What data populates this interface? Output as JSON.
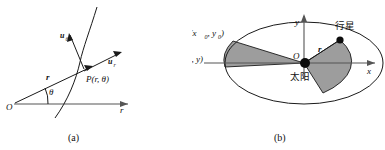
{
  "figure": {
    "background_color": "#ffffff",
    "ink_color": "#1a1a1a",
    "sector_fill_color": "#9d9d9d",
    "panels": [
      {
        "id": "a",
        "caption": "(a)",
        "title": "polar coordinate unit vectors at a point on a curve",
        "labels": {
          "origin": "O",
          "radial_axis": "r",
          "angle": "θ",
          "position_vector": "r",
          "unit_vector_theta": "u",
          "unit_vector_theta_sub": "θ",
          "unit_vector_r": "u",
          "unit_vector_r_sub": "r",
          "point": "P(r, θ)"
        }
      },
      {
        "id": "b",
        "caption": "(b)",
        "title": "Kepler equal-area law: planet orbiting the sun on an ellipse",
        "labels": {
          "y_axis": "y",
          "x_axis": "x",
          "origin": "O",
          "sun": "太阳",
          "planet": "行星",
          "radius": "r",
          "point_B": "B(x",
          "point_B_sub0": "0",
          "point_B_mid": ", y",
          "point_B_sub1": "0",
          "point_B_end": ")",
          "point_D": "D(x, y)"
        }
      }
    ]
  }
}
